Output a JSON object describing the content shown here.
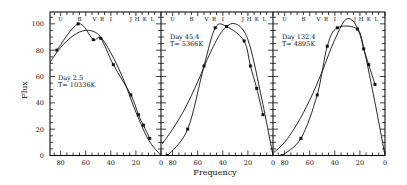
{
  "chart_data": {
    "type": "line",
    "title": "",
    "xlabel": "Frequency",
    "ylabel": "Flux",
    "ylim": [
      0,
      109
    ],
    "yticks": [
      0,
      20,
      40,
      60,
      80,
      100
    ],
    "xticks": [
      80,
      60,
      40,
      20,
      0
    ],
    "x_reversed": true,
    "grid": false,
    "band_labels": [
      "U",
      "B",
      "V",
      "R",
      "I",
      "J",
      "H",
      "K",
      "L"
    ],
    "band_positions": [
      80,
      65,
      53,
      47,
      40,
      24,
      19,
      13,
      7
    ],
    "panels": [
      {
        "label_day": "Day   2.5",
        "label_temp": "T= 10336K",
        "series": [
          {
            "name": "observed",
            "x": [
              83,
              66,
              54,
              48,
              38,
              24,
              18,
              14,
              9
            ],
            "values": [
              80,
              100,
              88,
              89,
              69,
              46,
              31,
              23,
              13
            ]
          },
          {
            "name": "blackbody-fit",
            "x": [
              89,
              80,
              70,
              60,
              50,
              40,
              30,
              20,
              10,
              0
            ],
            "values": [
              70,
              82,
              91,
              95,
              92,
              78,
              58,
              33,
              12,
              0
            ]
          }
        ]
      },
      {
        "label_day": "Day  45.4",
        "label_temp": "T= 5366K",
        "series": [
          {
            "name": "observed",
            "x": [
              84,
              68,
              55,
              46,
              37,
              23,
              18,
              13,
              8
            ],
            "values": [
              0,
              20,
              68,
              97,
              98,
              87,
              68,
              51,
              31
            ]
          },
          {
            "name": "blackbody-fit",
            "x": [
              89,
              80,
              70,
              60,
              50,
              40,
              30,
              20,
              10,
              0
            ],
            "values": [
              8,
              20,
              36,
              56,
              78,
              95,
              100,
              88,
              48,
              0
            ]
          }
        ]
      },
      {
        "label_day": "Day 132.4",
        "label_temp": "T= 4895K",
        "series": [
          {
            "name": "observed",
            "x": [
              82,
              67,
              54,
              46,
              38,
              22,
              17,
              13,
              8
            ],
            "values": [
              0,
              13,
              46,
              83,
              97,
              96,
              81,
              69,
              54
            ]
          },
          {
            "name": "blackbody-fit",
            "x": [
              89,
              80,
              70,
              60,
              50,
              40,
              30,
              20,
              10,
              0
            ],
            "values": [
              2,
              10,
              24,
              42,
              64,
              88,
              104,
              92,
              50,
              0
            ]
          }
        ]
      }
    ]
  },
  "axis": {
    "ylabel": "Flux",
    "xlabel": "Frequency",
    "ytick_labels": [
      "0",
      "20",
      "40",
      "60",
      "80",
      "100"
    ],
    "xtick_labels": [
      "80",
      "60",
      "40",
      "20",
      "0"
    ]
  }
}
